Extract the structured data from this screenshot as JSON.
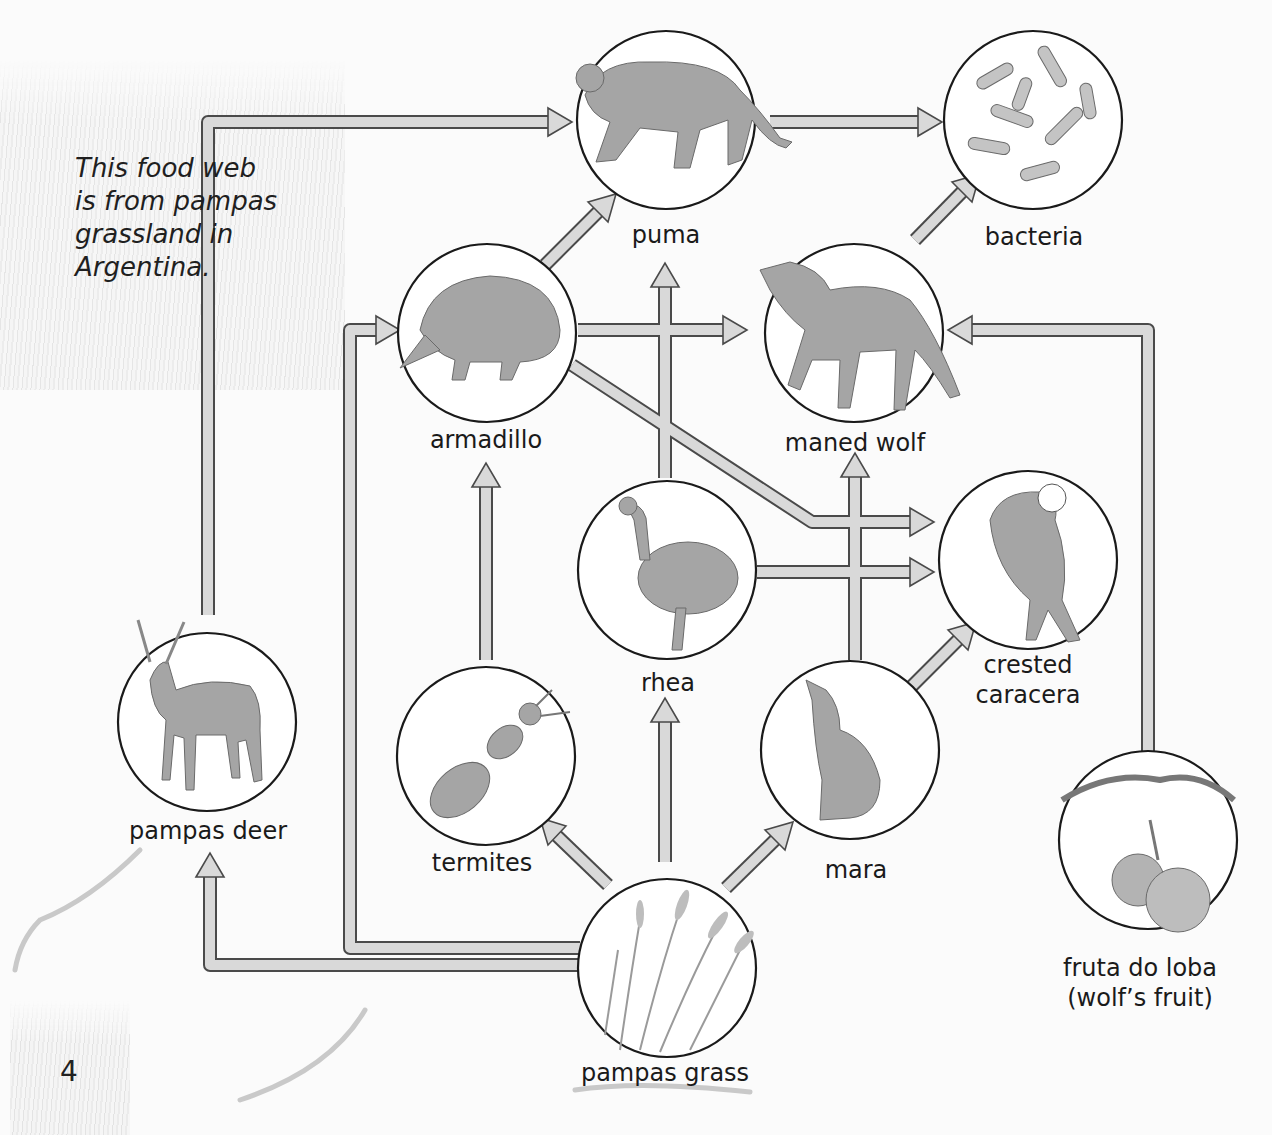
{
  "caption": {
    "lines": [
      "This food web",
      "is from pampas",
      "grassland in",
      "Argentina."
    ]
  },
  "page_number": "4",
  "colors": {
    "arrow_fill": "#d9d9d9",
    "arrow_stroke": "#4a4a4a",
    "circle_stroke": "#1a1a1a",
    "organism_tone": "#9a9a9a",
    "background": "#fbfbfb"
  },
  "organisms": [
    {
      "id": "puma",
      "label": "puma",
      "icon": "puma-icon"
    },
    {
      "id": "bacteria",
      "label": "bacteria",
      "icon": "bacteria-icon"
    },
    {
      "id": "armadillo",
      "label": "armadillo",
      "icon": "armadillo-icon"
    },
    {
      "id": "maned_wolf",
      "label": "maned wolf",
      "icon": "maned-wolf-icon"
    },
    {
      "id": "rhea",
      "label": "rhea",
      "icon": "rhea-icon"
    },
    {
      "id": "crested_caracera",
      "label_lines": [
        "crested",
        "caracera"
      ],
      "icon": "crested-caracara-icon"
    },
    {
      "id": "pampas_deer",
      "label": "pampas deer",
      "icon": "deer-icon"
    },
    {
      "id": "termites",
      "label": "termites",
      "icon": "termite-icon"
    },
    {
      "id": "mara",
      "label": "mara",
      "icon": "mara-icon"
    },
    {
      "id": "fruta_do_loba",
      "label_lines": [
        "fruta do loba",
        "(wolf’s fruit)"
      ],
      "icon": "fruit-icon"
    },
    {
      "id": "pampas_grass",
      "label": "pampas grass",
      "icon": "grass-icon"
    }
  ],
  "energy_flows": [
    {
      "from": "pampas_deer",
      "to": "puma"
    },
    {
      "from": "puma",
      "to": "bacteria"
    },
    {
      "from": "maned_wolf",
      "to": "bacteria"
    },
    {
      "from": "armadillo",
      "to": "puma"
    },
    {
      "from": "armadillo",
      "to": "maned_wolf"
    },
    {
      "from": "armadillo",
      "to": "crested_caracera"
    },
    {
      "from": "rhea",
      "to": "puma"
    },
    {
      "from": "rhea",
      "to": "crested_caracera"
    },
    {
      "from": "mara",
      "to": "maned_wolf"
    },
    {
      "from": "mara",
      "to": "crested_caracera"
    },
    {
      "from": "termites",
      "to": "armadillo"
    },
    {
      "from": "fruta_do_loba",
      "to": "maned_wolf"
    },
    {
      "from": "pampas_grass",
      "to": "pampas_deer"
    },
    {
      "from": "pampas_grass",
      "to": "armadillo"
    },
    {
      "from": "pampas_grass",
      "to": "termites"
    },
    {
      "from": "pampas_grass",
      "to": "rhea"
    },
    {
      "from": "pampas_grass",
      "to": "mara"
    }
  ]
}
